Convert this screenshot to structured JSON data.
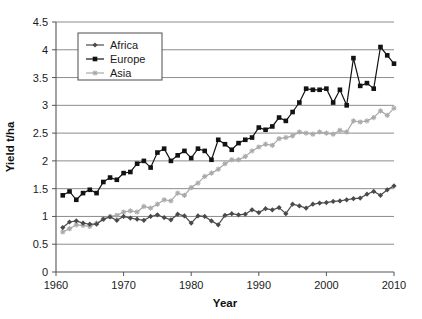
{
  "chart_data": {
    "type": "line",
    "title": "",
    "xlabel": "Year",
    "ylabel": "Yield t/ha",
    "xlim": [
      1960,
      2010
    ],
    "ylim": [
      0,
      4.5
    ],
    "ytick_step": 0.5,
    "xtick_step": 10,
    "grid": "horizontal",
    "legend_position": "top-left-inset",
    "xticks": [
      "1960",
      "1970",
      "1980",
      "1990",
      "2000",
      "2010"
    ],
    "yticks": [
      "0",
      "0.5",
      "1",
      "1.5",
      "2",
      "2.5",
      "3",
      "3.5",
      "4",
      "4.5"
    ],
    "x": [
      1961,
      1962,
      1963,
      1964,
      1965,
      1966,
      1967,
      1968,
      1969,
      1970,
      1971,
      1972,
      1973,
      1974,
      1975,
      1976,
      1977,
      1978,
      1979,
      1980,
      1981,
      1982,
      1983,
      1984,
      1985,
      1986,
      1987,
      1988,
      1989,
      1990,
      1991,
      1992,
      1993,
      1994,
      1995,
      1996,
      1997,
      1998,
      1999,
      2000,
      2001,
      2002,
      2003,
      2004,
      2005,
      2006,
      2007,
      2008,
      2009,
      2010
    ],
    "series": [
      {
        "name": "Africa",
        "color": "#4a4a4a",
        "marker": "diamond",
        "values": [
          0.8,
          0.9,
          0.92,
          0.88,
          0.86,
          0.86,
          0.95,
          0.99,
          0.93,
          1.0,
          0.97,
          0.95,
          0.93,
          1.0,
          1.03,
          0.98,
          0.94,
          1.04,
          1.01,
          0.88,
          1.01,
          1.0,
          0.92,
          0.85,
          1.02,
          1.05,
          1.03,
          1.04,
          1.12,
          1.07,
          1.14,
          1.12,
          1.16,
          1.05,
          1.22,
          1.19,
          1.15,
          1.22,
          1.24,
          1.25,
          1.27,
          1.28,
          1.3,
          1.32,
          1.33,
          1.4,
          1.45,
          1.38,
          1.48,
          1.55
        ]
      },
      {
        "name": "Europe",
        "color": "#121212",
        "marker": "square",
        "values": [
          1.38,
          1.45,
          1.3,
          1.42,
          1.48,
          1.42,
          1.62,
          1.7,
          1.66,
          1.78,
          1.8,
          1.95,
          2.0,
          1.88,
          2.15,
          2.22,
          2.0,
          2.1,
          2.18,
          2.05,
          2.22,
          2.18,
          2.02,
          2.38,
          2.3,
          2.2,
          2.32,
          2.38,
          2.42,
          2.6,
          2.56,
          2.62,
          2.78,
          2.72,
          2.88,
          3.05,
          3.3,
          3.28,
          3.28,
          3.3,
          3.05,
          3.28,
          3.0,
          3.85,
          3.35,
          3.4,
          3.3,
          4.05,
          3.9,
          3.75
        ]
      },
      {
        "name": "Asia",
        "color": "#a9a9a9",
        "marker": "star",
        "values": [
          0.72,
          0.78,
          0.85,
          0.84,
          0.82,
          0.88,
          0.95,
          1.0,
          1.02,
          1.08,
          1.1,
          1.08,
          1.18,
          1.15,
          1.22,
          1.3,
          1.28,
          1.42,
          1.38,
          1.52,
          1.6,
          1.72,
          1.78,
          1.85,
          1.95,
          2.02,
          2.02,
          2.08,
          2.18,
          2.25,
          2.3,
          2.28,
          2.4,
          2.42,
          2.45,
          2.52,
          2.5,
          2.48,
          2.52,
          2.5,
          2.48,
          2.55,
          2.52,
          2.72,
          2.7,
          2.72,
          2.78,
          2.9,
          2.82,
          2.95
        ]
      }
    ]
  },
  "legend": {
    "entries": [
      {
        "label": "Africa"
      },
      {
        "label": "Europe"
      },
      {
        "label": "Asia"
      }
    ]
  }
}
